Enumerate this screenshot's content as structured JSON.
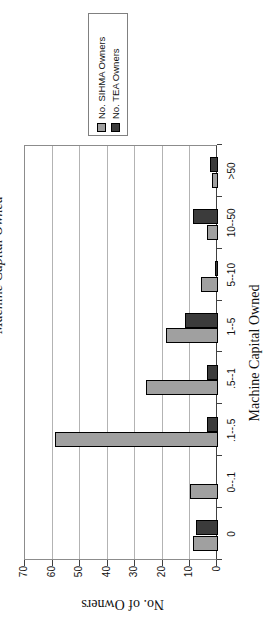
{
  "chart_data": {
    "type": "bar",
    "orientation": "landscape chart rotated 90deg counter-clockwise on portrait page",
    "clipped_title": "Machine Capital Owned",
    "xlabel": "Machine Capital Owned",
    "ylabel": "No. of Owners",
    "categories": [
      "0",
      "0--.1",
      ".1--.5",
      ".5--1",
      "1--5",
      "5--10",
      "10--50",
      ">50"
    ],
    "series": [
      {
        "name": "No. SIHMA Owners",
        "color": "#a0a0a0",
        "values": [
          9,
          10,
          59,
          26,
          19,
          6,
          4,
          2
        ]
      },
      {
        "name": "No. TEA Owners",
        "color": "#3b3b3b",
        "values": [
          8,
          0,
          4,
          4,
          12,
          1,
          9,
          3
        ]
      }
    ],
    "ylim": [
      0,
      70
    ],
    "yticks": [
      0,
      10,
      20,
      30,
      40,
      50,
      60,
      70
    ],
    "grid": true,
    "legend_position": "right"
  },
  "colors": {
    "bar_border": "#000000",
    "gridline": "#b3b3b3",
    "plot_border": "#8c8c8c",
    "axis_line": "#404040",
    "tick": "#404040",
    "legend_border": "#808080",
    "text": "#111111",
    "background": "#ffffff"
  }
}
